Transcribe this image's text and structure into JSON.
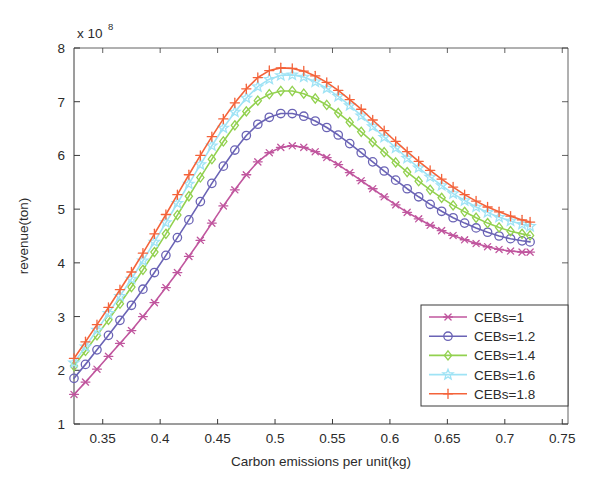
{
  "figure": {
    "background_color": "#ffffff",
    "axes_color": "#3a3a3a",
    "text_color": "#2b2b2b"
  },
  "chart_data": {
    "type": "line",
    "title": "",
    "subtitle": "",
    "xlabel": "Carbon emissions per unit(kg)",
    "ylabel": "revenue(ton)",
    "y_exponent_base": "x 10",
    "y_exponent_power": "8",
    "y_exponent_label": "x 10^8",
    "xlim": [
      0.325,
      0.755
    ],
    "ylim": [
      1,
      8
    ],
    "xticks": [
      0.35,
      0.4,
      0.45,
      0.5,
      0.55,
      0.6,
      0.65,
      0.7,
      0.75
    ],
    "xtick_labels": [
      "0.35",
      "0.4",
      "0.45",
      "0.5",
      "0.55",
      "0.6",
      "0.65",
      "0.7",
      "0.75"
    ],
    "yticks": [
      1,
      2,
      3,
      4,
      5,
      6,
      7,
      8
    ],
    "ytick_labels": [
      "1",
      "2",
      "3",
      "4",
      "5",
      "6",
      "7",
      "8"
    ],
    "grid": false,
    "legend_position": "lower right",
    "x": [
      0.325,
      0.335,
      0.345,
      0.355,
      0.365,
      0.375,
      0.385,
      0.395,
      0.405,
      0.415,
      0.425,
      0.435,
      0.445,
      0.455,
      0.465,
      0.475,
      0.485,
      0.495,
      0.505,
      0.515,
      0.525,
      0.535,
      0.545,
      0.555,
      0.565,
      0.575,
      0.585,
      0.595,
      0.605,
      0.615,
      0.625,
      0.635,
      0.645,
      0.655,
      0.665,
      0.675,
      0.685,
      0.695,
      0.705,
      0.715,
      0.722
    ],
    "series": [
      {
        "name": "CEBs=1",
        "color": "#c0569e",
        "marker": "asterisk",
        "values": [
          1.55,
          1.78,
          2.02,
          2.26,
          2.5,
          2.74,
          3.0,
          3.26,
          3.54,
          3.82,
          4.12,
          4.42,
          4.74,
          5.06,
          5.36,
          5.64,
          5.88,
          6.05,
          6.15,
          6.18,
          6.15,
          6.07,
          5.96,
          5.83,
          5.68,
          5.53,
          5.38,
          5.23,
          5.08,
          4.94,
          4.82,
          4.7,
          4.6,
          4.51,
          4.43,
          4.36,
          4.3,
          4.25,
          4.22,
          4.2,
          4.2
        ]
      },
      {
        "name": "CEBs=1.2",
        "color": "#6a63b5",
        "marker": "circle",
        "values": [
          1.85,
          2.11,
          2.38,
          2.65,
          2.93,
          3.21,
          3.51,
          3.82,
          4.14,
          4.47,
          4.8,
          5.14,
          5.48,
          5.8,
          6.1,
          6.37,
          6.58,
          6.71,
          6.78,
          6.78,
          6.73,
          6.64,
          6.52,
          6.38,
          6.22,
          6.05,
          5.88,
          5.71,
          5.54,
          5.38,
          5.23,
          5.09,
          4.96,
          4.84,
          4.74,
          4.65,
          4.57,
          4.5,
          4.45,
          4.41,
          4.39
        ]
      },
      {
        "name": "CEBs=1.4",
        "color": "#92d14f",
        "marker": "diamond",
        "values": [
          2.08,
          2.36,
          2.65,
          2.94,
          3.24,
          3.55,
          3.87,
          4.2,
          4.54,
          4.89,
          5.24,
          5.59,
          5.93,
          6.26,
          6.56,
          6.82,
          7.02,
          7.14,
          7.2,
          7.2,
          7.15,
          7.06,
          6.94,
          6.79,
          6.62,
          6.44,
          6.25,
          6.06,
          5.87,
          5.69,
          5.52,
          5.36,
          5.21,
          5.07,
          4.95,
          4.84,
          4.74,
          4.66,
          4.59,
          4.54,
          4.51
        ]
      },
      {
        "name": "CEBs=1.6",
        "color": "#9fe3f5",
        "marker": "pentagram",
        "values": [
          2.14,
          2.44,
          2.75,
          3.06,
          3.38,
          3.7,
          4.04,
          4.39,
          4.75,
          5.11,
          5.47,
          5.83,
          6.18,
          6.51,
          6.81,
          7.07,
          7.28,
          7.42,
          7.49,
          7.5,
          7.46,
          7.37,
          7.25,
          7.1,
          6.93,
          6.74,
          6.54,
          6.34,
          6.14,
          5.95,
          5.77,
          5.6,
          5.44,
          5.29,
          5.16,
          5.04,
          4.94,
          4.85,
          4.78,
          4.72,
          4.68
        ]
      },
      {
        "name": "CEBs=1.8",
        "color": "#f4633a",
        "marker": "plus",
        "values": [
          2.22,
          2.53,
          2.85,
          3.17,
          3.5,
          3.83,
          4.18,
          4.54,
          4.9,
          5.27,
          5.64,
          6.0,
          6.35,
          6.68,
          6.98,
          7.24,
          7.45,
          7.58,
          7.63,
          7.62,
          7.57,
          7.48,
          7.36,
          7.21,
          7.04,
          6.86,
          6.66,
          6.46,
          6.26,
          6.07,
          5.89,
          5.72,
          5.56,
          5.41,
          5.27,
          5.15,
          5.04,
          4.95,
          4.87,
          4.8,
          4.76
        ]
      }
    ]
  },
  "legend": {
    "entries": [
      {
        "label": "CEBs=1"
      },
      {
        "label": "CEBs=1.2"
      },
      {
        "label": "CEBs=1.4"
      },
      {
        "label": "CEBs=1.6"
      },
      {
        "label": "CEBs=1.8"
      }
    ]
  }
}
